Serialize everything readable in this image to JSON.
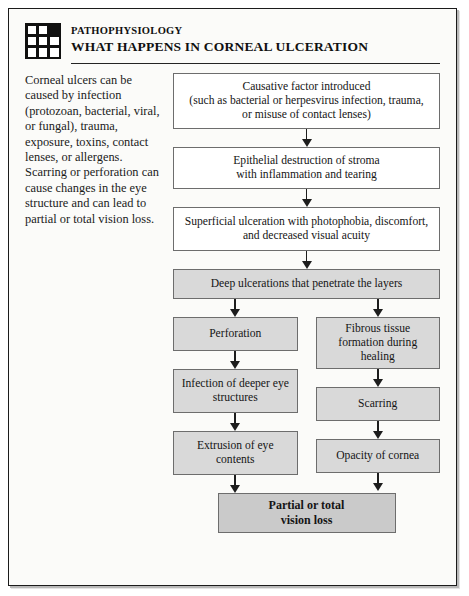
{
  "header": {
    "icon": "grid-icon",
    "kicker": "PATHOPHYSIOLOGY",
    "title": "WHAT HAPPENS IN CORNEAL ULCERATION"
  },
  "lede": {
    "text": "Corneal ulcers can be caused by infection (protozoan, bacterial, viral, or fungal), trauma, exposure, toxins, contact lenses, or allergens. Scarring or perforation can cause changes in the eye structure and can lead to partial or total vision loss."
  },
  "chart_data": {
    "type": "diagram",
    "title": "WHAT HAPPENS IN CORNEAL ULCERATION",
    "nodes": [
      {
        "id": "cause",
        "label": "Causative factor introduced (such as bacterial or herpesvirus infection, trauma, or misuse of contact lenses)",
        "fill": "#ffffff"
      },
      {
        "id": "epi",
        "label": "Epithelial destruction of stroma with inflammation and tearing",
        "fill": "#ffffff"
      },
      {
        "id": "super",
        "label": "Superficial ulceration with photophobia, discomfort, and decreased visual acuity",
        "fill": "#ffffff"
      },
      {
        "id": "deep",
        "label": "Deep ulcerations that penetrate the layers",
        "fill": "#d9d9d9"
      },
      {
        "id": "perf",
        "label": "Perforation",
        "fill": "#d9d9d9"
      },
      {
        "id": "infect",
        "label": "Infection of deeper eye structures",
        "fill": "#d9d9d9"
      },
      {
        "id": "extr",
        "label": "Extrusion of eye contents",
        "fill": "#d9d9d9"
      },
      {
        "id": "fibrous",
        "label": "Fibrous tissue formation during healing",
        "fill": "#d9d9d9"
      },
      {
        "id": "scar",
        "label": "Scarring",
        "fill": "#d9d9d9"
      },
      {
        "id": "opac",
        "label": "Opacity of cornea",
        "fill": "#d9d9d9"
      },
      {
        "id": "final",
        "label": "Partial or total vision loss",
        "fill": "#cacaca"
      }
    ],
    "edges": [
      {
        "from": "cause",
        "to": "epi"
      },
      {
        "from": "epi",
        "to": "super"
      },
      {
        "from": "super",
        "to": "deep"
      },
      {
        "from": "deep",
        "to": "perf"
      },
      {
        "from": "deep",
        "to": "fibrous"
      },
      {
        "from": "perf",
        "to": "infect"
      },
      {
        "from": "infect",
        "to": "extr"
      },
      {
        "from": "extr",
        "to": "final"
      },
      {
        "from": "fibrous",
        "to": "scar"
      },
      {
        "from": "scar",
        "to": "opac"
      },
      {
        "from": "opac",
        "to": "final"
      }
    ]
  },
  "boxes": {
    "cause_line1": "Causative factor introduced",
    "cause_line2": "(such as bacterial or herpesvirus infection, trauma,",
    "cause_line3": "or misuse of contact lenses)",
    "epi_line1": "Epithelial destruction of stroma",
    "epi_line2": "with inflammation and tearing",
    "super_line1": "Superficial ulceration with photophobia, discomfort,",
    "super_line2": "and decreased visual acuity",
    "deep": "Deep ulcerations that penetrate the layers",
    "perforation": "Perforation",
    "infection_line1": "Infection of deeper eye",
    "infection_line2": "structures",
    "extrusion_line1": "Extrusion of eye",
    "extrusion_line2": "contents",
    "fibrous_line1": "Fibrous tissue",
    "fibrous_line2": "formation during",
    "fibrous_line3": "healing",
    "scarring": "Scarring",
    "opacity": "Opacity of cornea",
    "final_line1": "Partial or total",
    "final_line2": "vision loss"
  },
  "colors": {
    "box_fill_white": "#ffffff",
    "box_fill_grey": "#d9d9d9",
    "box_fill_dark_grey": "#cacaca",
    "box_border": "#6d6d6d",
    "arrow": "#1d1d1d",
    "page_bg": "#fbfbf9",
    "page_border": "#1b1b1b",
    "text": "#151515"
  }
}
